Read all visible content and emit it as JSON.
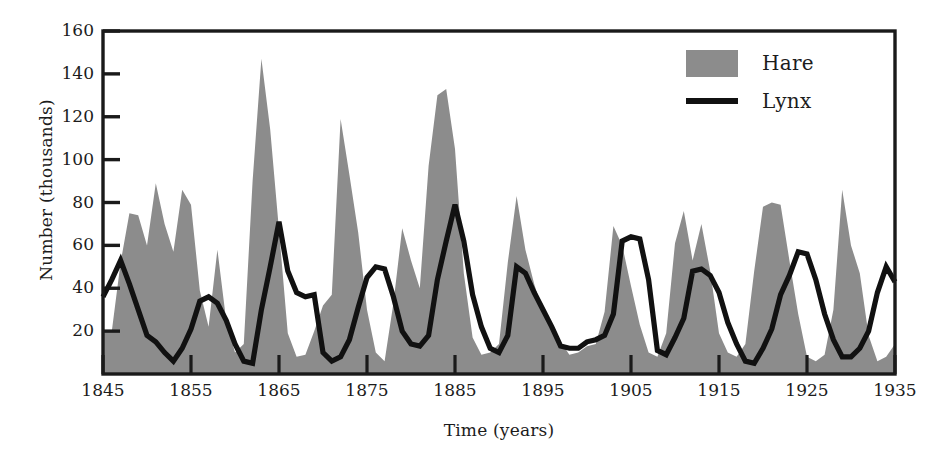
{
  "chart_data": {
    "type": "area",
    "title": "",
    "xlabel": "Time (years)",
    "ylabel": "Number (thousands)",
    "xlim": [
      1845,
      1935
    ],
    "ylim": [
      0,
      160
    ],
    "xticks": [
      1845,
      1855,
      1865,
      1875,
      1885,
      1895,
      1905,
      1915,
      1925,
      1935
    ],
    "yticks": [
      20,
      40,
      60,
      80,
      100,
      120,
      140,
      160
    ],
    "grid": false,
    "legend_position": "top-right",
    "colors": {
      "hare_fill": "#8c8c8c",
      "lynx_line": "#111111",
      "axis": "#1a1a1a",
      "background": "#ffffff"
    },
    "x": [
      1845,
      1846,
      1847,
      1848,
      1849,
      1850,
      1851,
      1852,
      1853,
      1854,
      1855,
      1856,
      1857,
      1858,
      1859,
      1860,
      1861,
      1862,
      1863,
      1864,
      1865,
      1866,
      1867,
      1868,
      1869,
      1870,
      1871,
      1872,
      1873,
      1874,
      1875,
      1876,
      1877,
      1878,
      1879,
      1880,
      1881,
      1882,
      1883,
      1884,
      1885,
      1886,
      1887,
      1888,
      1889,
      1890,
      1891,
      1892,
      1893,
      1894,
      1895,
      1896,
      1897,
      1898,
      1899,
      1900,
      1901,
      1902,
      1903,
      1904,
      1905,
      1906,
      1907,
      1908,
      1909,
      1910,
      1911,
      1912,
      1913,
      1914,
      1915,
      1916,
      1917,
      1918,
      1919,
      1920,
      1921,
      1922,
      1923,
      1924,
      1925,
      1926,
      1927,
      1928,
      1929,
      1930,
      1931,
      1932,
      1933,
      1934,
      1935
    ],
    "series": [
      {
        "name": "Hare",
        "kind": "filled-area",
        "color": "#8c8c8c",
        "units": "thousands",
        "values": [
          20,
          20,
          52,
          75,
          74,
          60,
          89,
          70,
          57,
          86,
          79,
          39,
          22,
          58,
          25,
          10,
          14,
          90,
          147,
          114,
          67,
          19,
          8,
          9,
          20,
          32,
          37,
          119,
          93,
          66,
          30,
          10,
          6,
          33,
          68,
          53,
          40,
          97,
          130,
          133,
          105,
          47,
          17,
          9,
          10,
          14,
          52,
          83,
          58,
          42,
          29,
          20,
          15,
          9,
          10,
          13,
          14,
          29,
          69,
          60,
          41,
          23,
          10,
          8,
          19,
          61,
          76,
          53,
          70,
          48,
          19,
          10,
          8,
          14,
          48,
          78,
          80,
          79,
          53,
          28,
          8,
          6,
          9,
          30,
          86,
          60,
          47,
          18,
          6,
          8,
          14
        ]
      },
      {
        "name": "Lynx",
        "kind": "line",
        "color": "#111111",
        "units": "thousands",
        "values": [
          36,
          44,
          53,
          42,
          30,
          18,
          15,
          10,
          6,
          12,
          21,
          34,
          36,
          33,
          25,
          14,
          6,
          5,
          30,
          50,
          71,
          48,
          38,
          36,
          37,
          10,
          6,
          8,
          16,
          31,
          45,
          50,
          49,
          36,
          20,
          14,
          13,
          18,
          44,
          62,
          79,
          62,
          37,
          22,
          12,
          10,
          18,
          50,
          47,
          38,
          30,
          22,
          13,
          12,
          12,
          15,
          16,
          18,
          28,
          62,
          64,
          63,
          44,
          11,
          9,
          17,
          26,
          48,
          49,
          46,
          38,
          24,
          14,
          6,
          5,
          12,
          21,
          37,
          46,
          57,
          56,
          44,
          28,
          16,
          8,
          8,
          12,
          20,
          38,
          50,
          43
        ]
      }
    ]
  },
  "axes": {
    "y_title": "Number (thousands)",
    "x_title": "Time (years)",
    "y_tick_labels": [
      "160",
      "140",
      "120",
      "100",
      "80",
      "60",
      "40",
      "20"
    ],
    "x_tick_labels": [
      "1845",
      "1855",
      "1865",
      "1875",
      "1885",
      "1895",
      "1905",
      "1915",
      "1925",
      "1935"
    ]
  },
  "legend": {
    "items": [
      {
        "label": "Hare",
        "marker": "filled-square-swatch",
        "color": "#8c8c8c"
      },
      {
        "label": "Lynx",
        "marker": "solid-line-swatch",
        "color": "#111111"
      }
    ]
  }
}
